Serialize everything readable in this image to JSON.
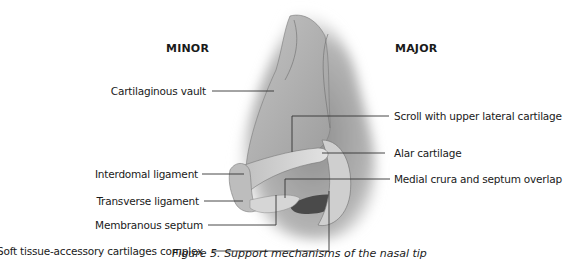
{
  "figure": {
    "headings": {
      "left": "MINOR",
      "right": "MAJOR"
    },
    "labels_left": [
      {
        "id": "cartilaginous-vault",
        "text": "Cartilaginous vault"
      },
      {
        "id": "interdomal-ligament",
        "text": "Interdomal ligament"
      },
      {
        "id": "transverse-ligament",
        "text": "Transverse ligament"
      },
      {
        "id": "membranous-septum",
        "text": "Membranous septum"
      },
      {
        "id": "soft-tissue-accessory",
        "text": "Soft tissue-accessory cartilages complex"
      }
    ],
    "labels_right": [
      {
        "id": "scroll",
        "text": "Scroll with upper lateral cartilage"
      },
      {
        "id": "alar-cartilage",
        "text": "Alar cartilage"
      },
      {
        "id": "medial-crura",
        "text": "Medial crura and septum overlap"
      }
    ],
    "caption": {
      "number": "Figure 5.",
      "text": "Support mechanisms of the nasal tip"
    },
    "colors": {
      "text": "#1a1a1a",
      "leader_line": "#333333",
      "illustration_gray": "#9a9a9a",
      "background": "#ffffff"
    }
  }
}
